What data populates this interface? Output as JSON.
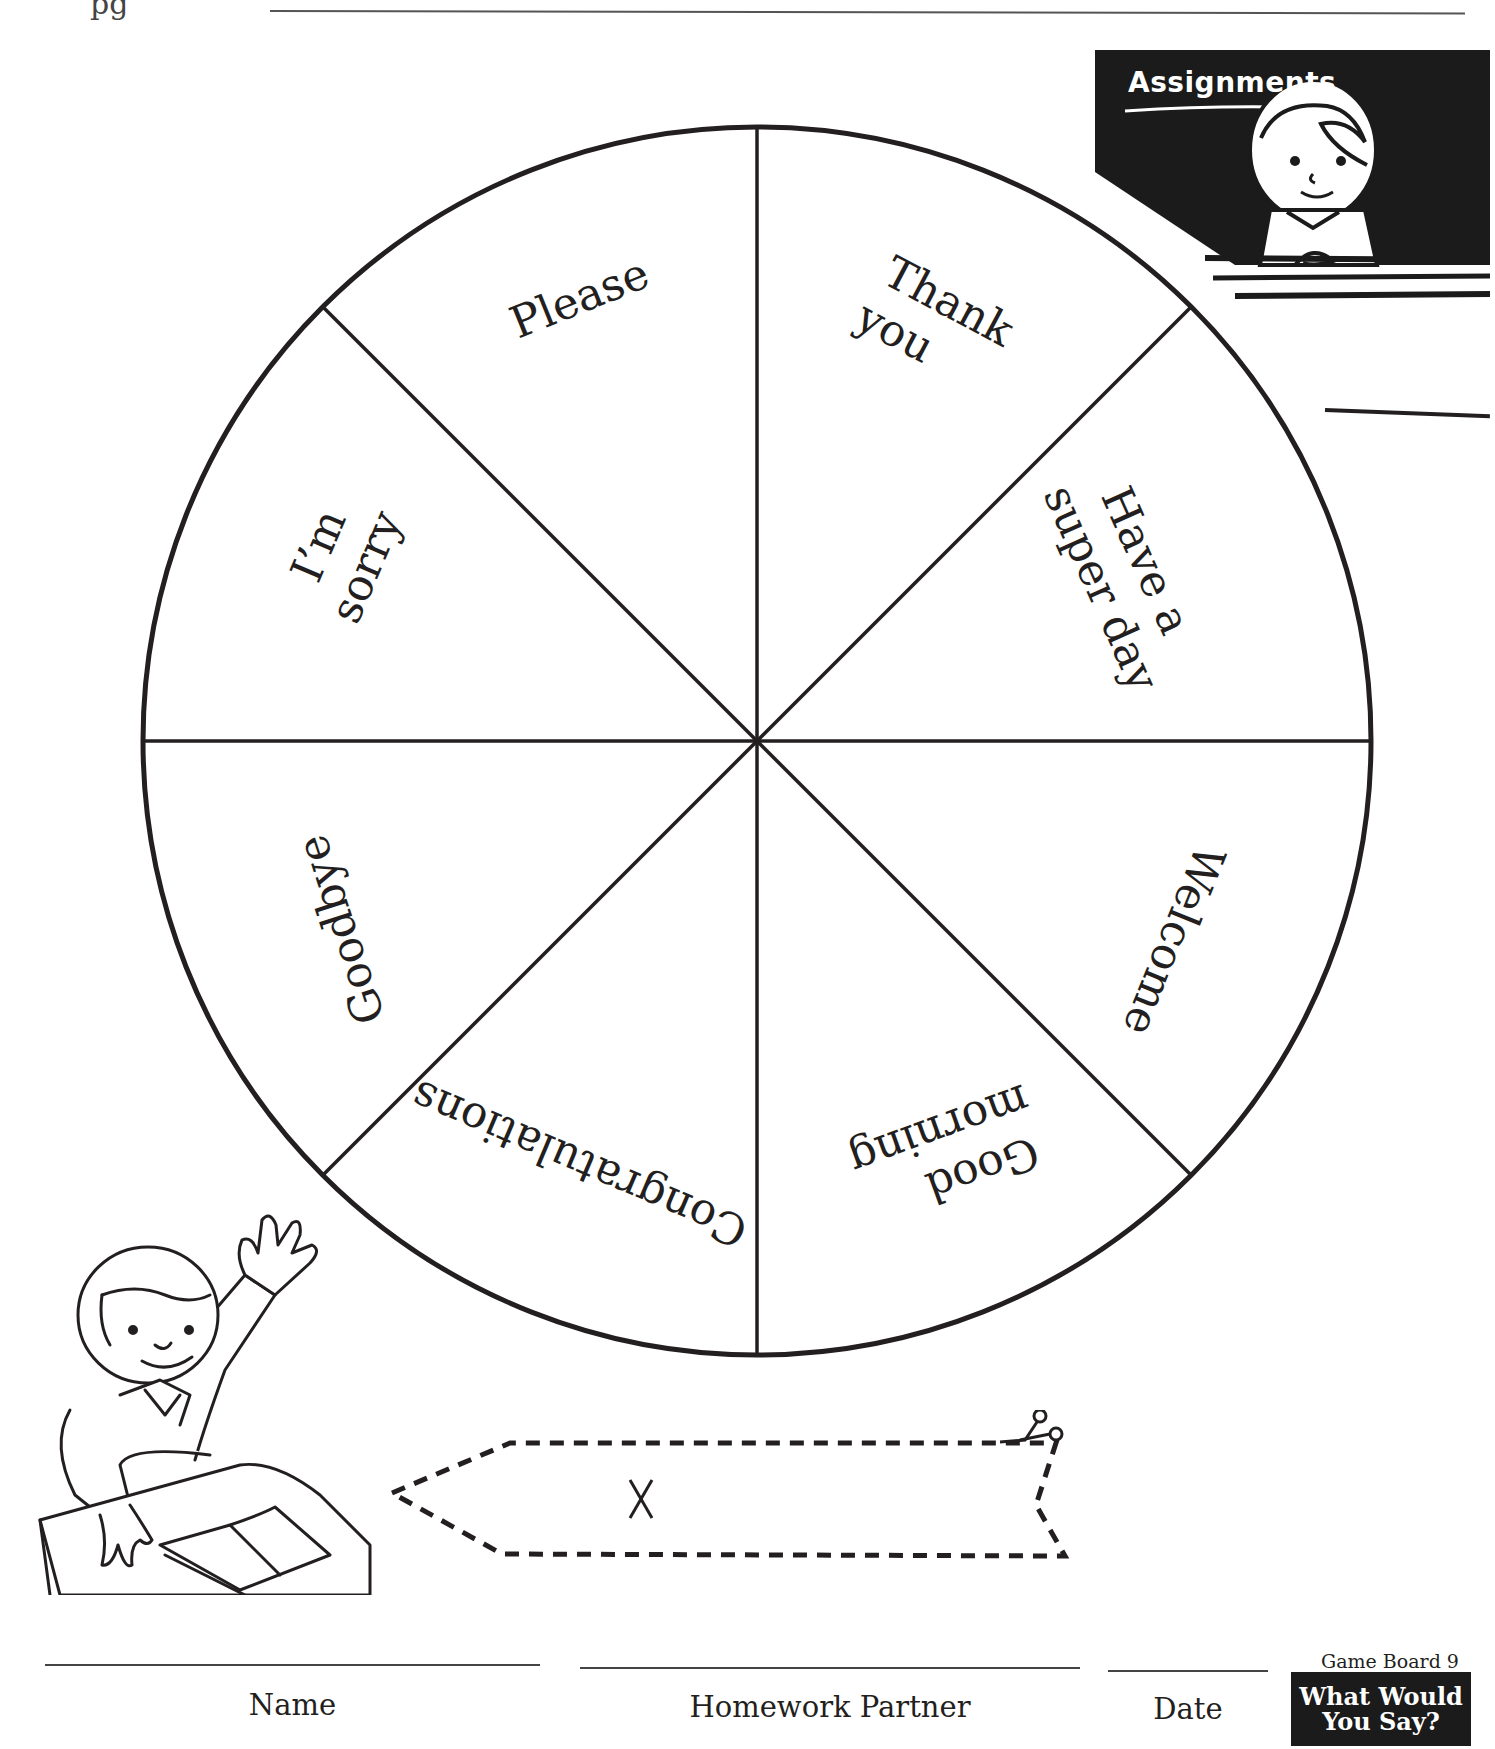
{
  "header": {
    "page_stub": "pg"
  },
  "assignments_panel": {
    "title": "Assignments",
    "illustration": "girl-at-desk"
  },
  "wheel": {
    "segment_count": 8,
    "segments": [
      {
        "label_lines": [
          "Thank",
          "you"
        ],
        "position": "top-right"
      },
      {
        "label_lines": [
          "Have a",
          "super day"
        ],
        "position": "right-upper"
      },
      {
        "label_lines": [
          "Welcome"
        ],
        "position": "right-lower"
      },
      {
        "label_lines": [
          "Good",
          "morning"
        ],
        "position": "bottom-right"
      },
      {
        "label_lines": [
          "Congratulations"
        ],
        "position": "bottom-left"
      },
      {
        "label_lines": [
          "Goodbye"
        ],
        "position": "left-lower"
      },
      {
        "label_lines": [
          "I’m",
          "sorry"
        ],
        "position": "left-upper"
      },
      {
        "label_lines": [
          "Please"
        ],
        "position": "top-left"
      }
    ]
  },
  "pointer_cutout": {
    "center_mark": "X",
    "icon": "scissors-icon"
  },
  "footer": {
    "fields": [
      {
        "label": "Name"
      },
      {
        "label": "Homework Partner"
      },
      {
        "label": "Date"
      }
    ],
    "game_board_caption": "Game Board 9",
    "badge_line1": "What Would",
    "badge_line2": "You Say?"
  },
  "colors": {
    "ink": "#231f20",
    "panel": "#1b1b1b",
    "paper": "#ffffff"
  }
}
